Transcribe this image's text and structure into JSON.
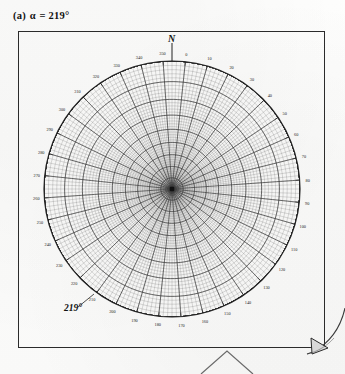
{
  "figure": {
    "caption_prefix": "(a)",
    "caption_symbol": "α",
    "caption_equals": "=",
    "caption_value": "219°",
    "caption_full": "(a) α = 219°",
    "north_label": "N",
    "alpha_annotation": "219°",
    "center_marker": "center-dot",
    "frame_color": "#2b2b2b",
    "grid_color": "#3a3a3a",
    "background_color": "#fdfdfc"
  },
  "chart_data": {
    "type": "scatter",
    "projection": "stereographic-wulff-net",
    "title": "(a) α = 219°",
    "xlabel": "",
    "ylabel": "",
    "rotation_alpha_deg": 219,
    "primitive_circle_radius_px": 128,
    "center_px": [
      154,
      158
    ],
    "grid": true,
    "legend": false,
    "meridian_step_deg": 10,
    "parallel_step_deg": 10,
    "fine_subdivision_deg": 2,
    "pole_positions_deg": [
      0,
      180
    ],
    "azimuth_tick_step_deg": 10,
    "azimuth_label_step_deg": 10,
    "azimuth_labels": [
      "0",
      "10",
      "20",
      "30",
      "40",
      "50",
      "60",
      "70",
      "80",
      "90",
      "100",
      "110",
      "120",
      "130",
      "140",
      "150",
      "160",
      "170",
      "180",
      "190",
      "200",
      "210",
      "220",
      "230",
      "240",
      "250",
      "260",
      "270",
      "280",
      "290",
      "300",
      "310",
      "320",
      "330",
      "340",
      "350"
    ],
    "annotations": [
      {
        "text": "N",
        "position": "top-outside",
        "angle_deg": 0
      },
      {
        "text": "219°",
        "position": "lower-left-inside",
        "angle_deg": 219
      }
    ]
  }
}
